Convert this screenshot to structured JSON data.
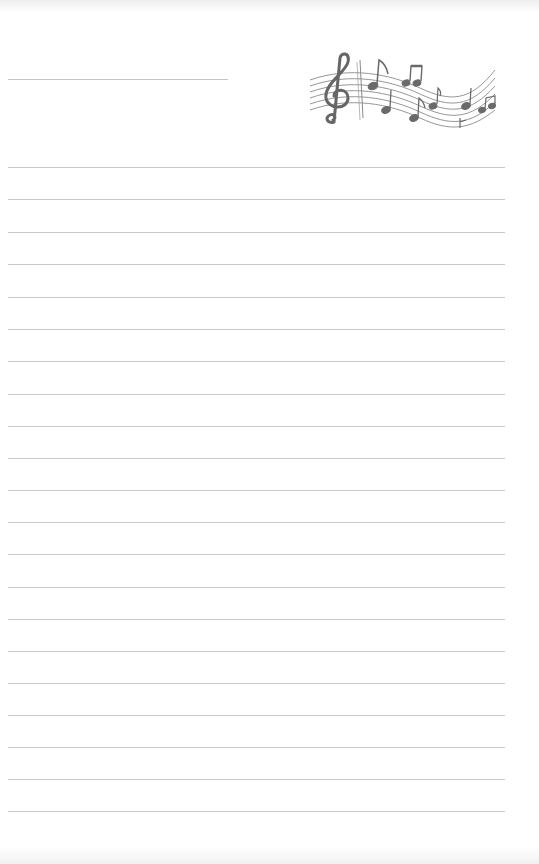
{
  "page": {
    "type": "lined writing paper",
    "background_color": "#ffffff",
    "line_color": "#c9c9c9",
    "header_line": {
      "x": 8,
      "y": 79,
      "width": 220
    },
    "ruled_lines": {
      "count": 21,
      "x": 8,
      "width": 497,
      "y_positions": [
        167,
        199,
        232,
        264,
        297,
        329,
        361,
        394,
        426,
        458,
        490,
        522,
        554,
        587,
        619,
        651,
        683,
        715,
        747,
        779,
        811
      ]
    },
    "illustration": {
      "icon": "music-staff-treble-clef-notes-icon",
      "color": "#6f6f6f"
    }
  }
}
